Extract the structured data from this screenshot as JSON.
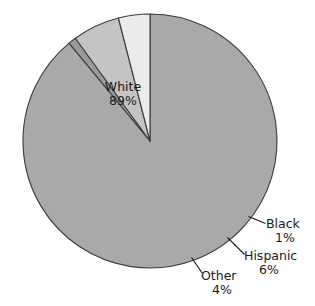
{
  "chart_data": {
    "type": "pie",
    "title": "",
    "categories": [
      "White",
      "Black",
      "Hispanic",
      "Other"
    ],
    "values": [
      89,
      1,
      6,
      4
    ],
    "value_labels": [
      "89%",
      "1%",
      "6%",
      "4%"
    ],
    "unit": "%",
    "legend": "none",
    "slice_colors": [
      "#a9a9a9",
      "#9a9a9a",
      "#c4c4c4",
      "#ebebeb"
    ],
    "outline_color": "#3c3c3c",
    "background": "#ffffff",
    "start_angle_deg": 90,
    "direction": "clockwise",
    "slices": [
      {
        "name": "White",
        "percent": 89,
        "label": "White",
        "pct_label": "89%",
        "color": "#a9a9a9",
        "label_placement": "inside"
      },
      {
        "name": "Black",
        "percent": 1,
        "label": "Black",
        "pct_label": "1%",
        "color": "#9a9a9a",
        "label_placement": "outside-leader"
      },
      {
        "name": "Hispanic",
        "percent": 6,
        "label": "Hispanic",
        "pct_label": "6%",
        "color": "#c4c4c4",
        "label_placement": "outside-leader"
      },
      {
        "name": "Other",
        "percent": 4,
        "label": "Other",
        "pct_label": "4%",
        "color": "#ebebeb",
        "label_placement": "outside-leader"
      }
    ]
  },
  "labels": {
    "white": {
      "name": "White",
      "pct": "89%"
    },
    "black": {
      "name": "Black",
      "pct": "1%"
    },
    "hispanic": {
      "name": "Hispanic",
      "pct": "6%"
    },
    "other": {
      "name": "Other",
      "pct": "4%"
    }
  }
}
